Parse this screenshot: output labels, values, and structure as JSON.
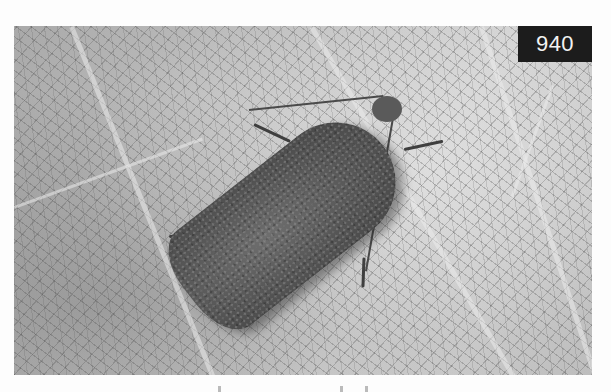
{
  "photo": {
    "subject": "moth resting on leaf",
    "tone": "grayscale",
    "colors": {
      "leaf_light": "#d4d4d4",
      "leaf_dark": "#a9a9a9",
      "moth_body": "#555555",
      "border": "#6a6a6a"
    }
  },
  "badge": {
    "number": "940",
    "background": "#1c1c1c",
    "text_color": "#f2f2f2"
  }
}
